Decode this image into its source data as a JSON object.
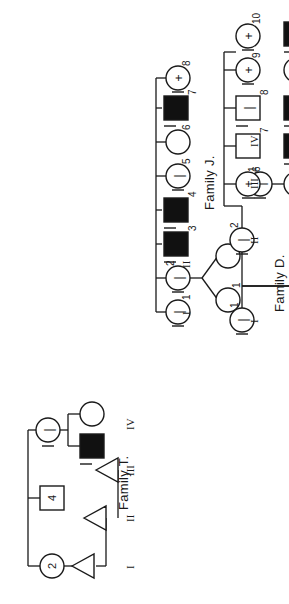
{
  "figure": {
    "kind": "pedigree-chart-set",
    "rotation_deg": -90,
    "background": "#ffffff",
    "stroke": "#1a1a1a",
    "fill_affected": "#111111"
  },
  "symbols": {
    "square": "male",
    "circle": "female",
    "triangle": "pregnancy-loss",
    "filled": "affected",
    "plus_mark": "+",
    "minus_mark": "|",
    "blank_mark": ""
  },
  "families": [
    {
      "id": "family-t",
      "title": "Family T.",
      "generations": [
        "I",
        "II",
        "III",
        "IV"
      ],
      "members": [
        {
          "gen": "I",
          "idx": 1,
          "shape": "circle",
          "mark": "2",
          "filled": false,
          "slash": false
        },
        {
          "gen": "I",
          "idx": 2,
          "shape": "square",
          "mark": "4",
          "filled": false,
          "slash": false
        },
        {
          "gen": "I",
          "idx": 3,
          "shape": "circle",
          "mark": "|",
          "filled": false,
          "slash": true
        },
        {
          "gen": "I",
          "idx": 4,
          "shape": "square",
          "mark": "",
          "filled": true,
          "slash": true
        },
        {
          "gen": "I",
          "idx": 5,
          "shape": "circle",
          "mark": "",
          "filled": false,
          "slash": false
        },
        {
          "gen": "II",
          "idx": 1,
          "shape": "triangle",
          "mark": "",
          "filled": false,
          "slash": false
        },
        {
          "gen": "III",
          "idx": 1,
          "shape": "triangle",
          "mark": "",
          "filled": false,
          "slash": false
        },
        {
          "gen": "IV",
          "idx": 1,
          "shape": "triangle",
          "mark": "",
          "filled": false,
          "slash": false
        }
      ]
    },
    {
      "id": "family-j",
      "title": "Family J.",
      "generations": [
        "I",
        "II"
      ],
      "gen1": [
        {
          "id": "1",
          "shape": "circle",
          "mark": "|",
          "filled": false,
          "slash": true
        },
        {
          "id": "2",
          "shape": "circle",
          "mark": "|",
          "filled": false,
          "slash": true
        },
        {
          "id": "3",
          "shape": "square",
          "mark": "",
          "filled": true,
          "slash": true
        },
        {
          "id": "4",
          "shape": "square",
          "mark": "",
          "filled": true,
          "slash": true
        },
        {
          "id": "5",
          "shape": "circle",
          "mark": "|",
          "filled": false,
          "slash": true
        },
        {
          "id": "6",
          "shape": "circle",
          "mark": "",
          "filled": false,
          "slash": false
        },
        {
          "id": "7",
          "shape": "square",
          "mark": "",
          "filled": true,
          "slash": true
        },
        {
          "id": "8",
          "shape": "circle",
          "mark": "+",
          "filled": false,
          "slash": true
        }
      ],
      "gen2": [
        {
          "id": "1",
          "shape": "circle",
          "mark": "",
          "filled": false,
          "slash": false
        },
        {
          "id": "2",
          "shape": "circle",
          "mark": "",
          "filled": false,
          "slash": false
        }
      ]
    },
    {
      "id": "family-d",
      "title": "Family D.",
      "generations": [
        "I",
        "II",
        "III",
        "IV"
      ],
      "gen1": [
        {
          "id": "1",
          "shape": "circle",
          "mark": "|",
          "filled": false,
          "slash": true
        }
      ],
      "gen2": [
        {
          "id": "1",
          "shape": "circle",
          "mark": "|",
          "filled": false,
          "slash": true
        },
        {
          "id": "2",
          "shape": "circle",
          "mark": "|",
          "filled": false,
          "slash": true
        }
      ],
      "gen3": [
        {
          "id": "1",
          "shape": "circle",
          "mark": "|",
          "filled": false,
          "slash": true
        },
        {
          "id": "2",
          "shape": "square",
          "mark": "",
          "filled": true,
          "slash": true
        },
        {
          "id": "3",
          "shape": "square",
          "mark": "",
          "filled": true,
          "slash": true
        },
        {
          "id": "4",
          "shape": "circle",
          "mark": "+",
          "filled": false,
          "slash": true
        },
        {
          "id": "5",
          "shape": "square",
          "mark": "",
          "filled": true,
          "slash": true
        },
        {
          "id": "6",
          "shape": "circle",
          "mark": "+",
          "filled": false,
          "slash": true
        },
        {
          "id": "7",
          "shape": "square",
          "mark": "",
          "filled": false,
          "slash": false
        },
        {
          "id": "8",
          "shape": "square",
          "mark": "|",
          "filled": false,
          "slash": true
        },
        {
          "id": "9",
          "shape": "circle",
          "mark": "+",
          "filled": false,
          "slash": true
        },
        {
          "id": "10",
          "shape": "circle",
          "mark": "+",
          "filled": false,
          "slash": true
        }
      ],
      "gen4": [
        {
          "id": "1",
          "shape": "circle",
          "mark": "|",
          "filled": false,
          "slash": true
        }
      ]
    }
  ]
}
